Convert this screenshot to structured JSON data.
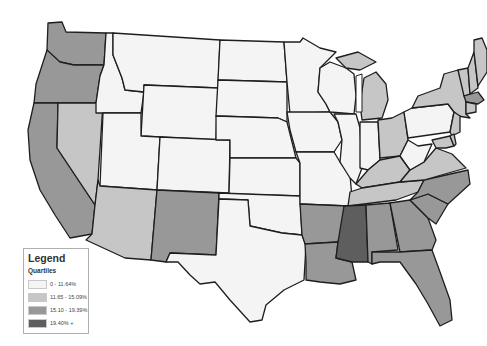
{
  "map": {
    "type": "choropleth",
    "region": "Contiguous United States (county level)",
    "fill_by": "quartile",
    "states": [
      {
        "id": "WA",
        "q": 3
      },
      {
        "id": "OR",
        "q": 3
      },
      {
        "id": "CA",
        "q": 3
      },
      {
        "id": "NV",
        "q": 2
      },
      {
        "id": "ID",
        "q": 1
      },
      {
        "id": "MT",
        "q": 1
      },
      {
        "id": "WY",
        "q": 1
      },
      {
        "id": "UT",
        "q": 1
      },
      {
        "id": "AZ",
        "q": 2
      },
      {
        "id": "CO",
        "q": 1
      },
      {
        "id": "NM",
        "q": 3
      },
      {
        "id": "ND",
        "q": 1
      },
      {
        "id": "SD",
        "q": 1
      },
      {
        "id": "NE",
        "q": 1
      },
      {
        "id": "KS",
        "q": 1
      },
      {
        "id": "OK",
        "q": 1
      },
      {
        "id": "TX",
        "q": 1
      },
      {
        "id": "MN",
        "q": 1
      },
      {
        "id": "IA",
        "q": 1
      },
      {
        "id": "MO",
        "q": 1
      },
      {
        "id": "AR",
        "q": 3
      },
      {
        "id": "LA",
        "q": 3
      },
      {
        "id": "WI",
        "q": 1
      },
      {
        "id": "IL",
        "q": 1
      },
      {
        "id": "MI",
        "q": 2
      },
      {
        "id": "IN",
        "q": 1
      },
      {
        "id": "OH",
        "q": 2
      },
      {
        "id": "KY",
        "q": 2
      },
      {
        "id": "TN",
        "q": 2
      },
      {
        "id": "MS",
        "q": 4
      },
      {
        "id": "AL",
        "q": 3
      },
      {
        "id": "GA",
        "q": 3
      },
      {
        "id": "FL",
        "q": 3
      },
      {
        "id": "SC",
        "q": 3
      },
      {
        "id": "NC",
        "q": 3
      },
      {
        "id": "VA",
        "q": 2
      },
      {
        "id": "WV",
        "q": 1
      },
      {
        "id": "PA",
        "q": 1
      },
      {
        "id": "NY",
        "q": 2
      },
      {
        "id": "VT",
        "q": 2
      },
      {
        "id": "NH",
        "q": 2
      },
      {
        "id": "ME",
        "q": 2
      },
      {
        "id": "MA",
        "q": 3
      },
      {
        "id": "CT",
        "q": 2
      },
      {
        "id": "NJ",
        "q": 2
      },
      {
        "id": "MD",
        "q": 2
      },
      {
        "id": "DE",
        "q": 2
      }
    ]
  },
  "legend": {
    "title": "Legend",
    "subtitle": "Quartiles",
    "items": [
      {
        "label": "0 - 11.64%",
        "color": "#f4f4f4"
      },
      {
        "label": "11.65 - 15.09%",
        "color": "#c6c6c6"
      },
      {
        "label": "15.10 - 19.39%",
        "color": "#989898"
      },
      {
        "label": "19.40% +",
        "color": "#5e5e5e"
      }
    ]
  },
  "colors": {
    "q1": "#f4f4f4",
    "q2": "#c6c6c6",
    "q3": "#989898",
    "q4": "#5e5e5e",
    "border": "#1e1e1e"
  }
}
